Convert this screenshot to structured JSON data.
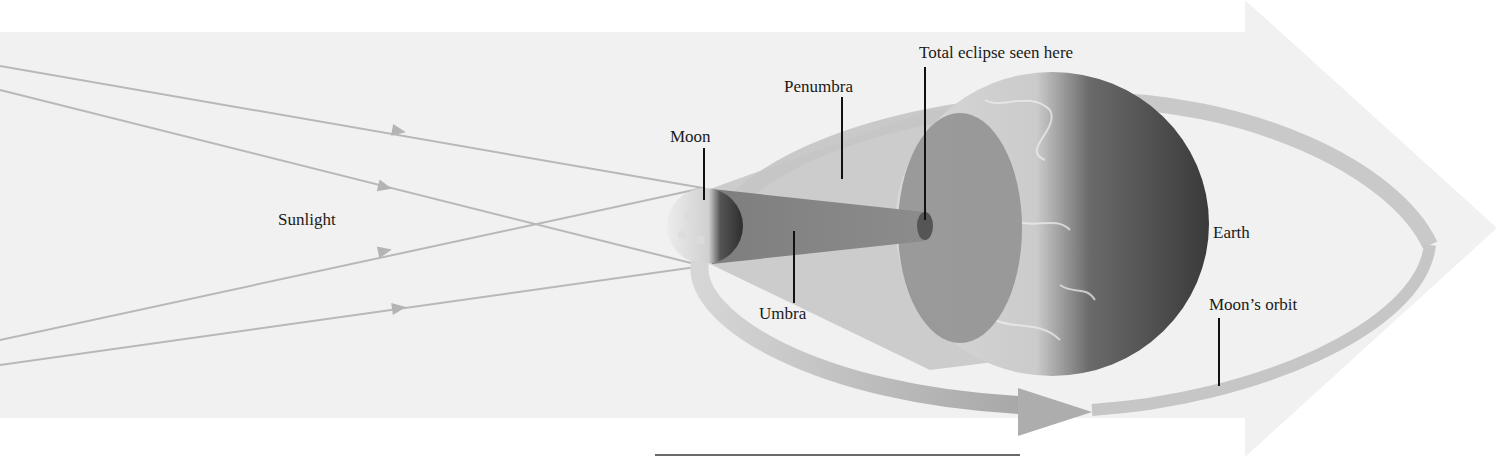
{
  "diagram": {
    "labels": {
      "sunlight": "Sunlight",
      "moon": "Moon",
      "penumbra": "Penumbra",
      "total_eclipse": "Total eclipse seen here",
      "umbra": "Umbra",
      "earth": "Earth",
      "moons_orbit": "Moon’s orbit"
    },
    "colors": {
      "background_arrow": "#f2f2f2",
      "sun_rays": "#b8b8b8",
      "orbit_band": "#bdbdbd",
      "penumbra": "#c8c8c8",
      "umbra": "#8f8f8f",
      "earth_light": "#cfcfcf",
      "earth_dark": "#4a4a4a",
      "leader_lines": "#111111"
    },
    "elements": [
      {
        "name": "sun-rays",
        "count": 4
      },
      {
        "name": "moon"
      },
      {
        "name": "penumbra-cone"
      },
      {
        "name": "umbra-cone"
      },
      {
        "name": "earth"
      },
      {
        "name": "moon-orbit",
        "direction": "counterclockwise-arrow"
      }
    ]
  }
}
